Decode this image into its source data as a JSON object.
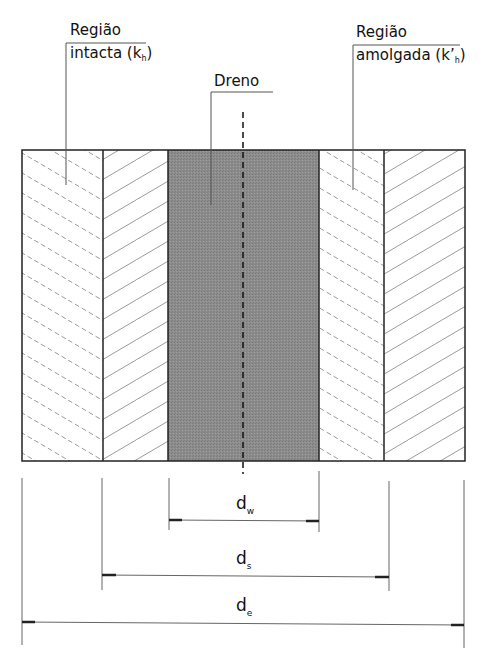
{
  "labels": {
    "intact": {
      "line1": "Região",
      "line2_pre": "intacta (k",
      "line2_sub": "h",
      "line2_post": ")"
    },
    "drain": {
      "text": "Dreno"
    },
    "smear": {
      "line1": "Região",
      "line2_pre": "amolgada (k’",
      "line2_sub": "h",
      "line2_post": ")"
    }
  },
  "dimensions": [
    {
      "id": "dw",
      "base": "d",
      "sub": "w"
    },
    {
      "id": "ds",
      "base": "d",
      "sub": "s"
    },
    {
      "id": "de",
      "base": "d",
      "sub": "e"
    }
  ],
  "colors": {
    "drain_fill": "#8c8c8c",
    "hatch": "#9a9a9a",
    "outline": "#222222"
  },
  "regions": [
    {
      "name": "intact-left",
      "hatch": "dashed-backslash"
    },
    {
      "name": "smear-left",
      "hatch": "solid-slash"
    },
    {
      "name": "drain",
      "hatch": "solid-fill"
    },
    {
      "name": "smear-right",
      "hatch": "dashed-backslash"
    },
    {
      "name": "intact-right",
      "hatch": "solid-slash"
    }
  ]
}
